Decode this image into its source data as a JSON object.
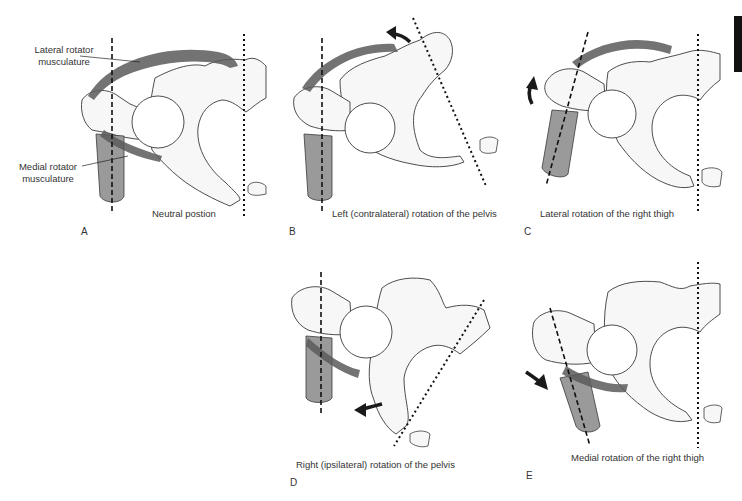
{
  "figure": {
    "colors": {
      "bone_fill": "#f7f7f7",
      "bone_outline": "#3a3a3a",
      "muscle": "#5a5a5a",
      "thigh": "#9a9a9a",
      "arrow": "#1a1a1a",
      "tab_marker": "#111111"
    },
    "callouts": {
      "lateral": "Lateral rotator musculature",
      "lateral_line1": "Lateral rotator",
      "lateral_line2": "musculature",
      "medial": "Medial rotator musculature",
      "medial_line1": "Medial rotator",
      "medial_line2": "musculature"
    },
    "panels": [
      {
        "letter": "A",
        "caption": "Neutral postion"
      },
      {
        "letter": "B",
        "caption": "Left (contralateral) rotation of the pelvis"
      },
      {
        "letter": "C",
        "caption": "Lateral rotation of the right thigh"
      },
      {
        "letter": "D",
        "caption": "Right (ipsilateral) rotation of the pelvis"
      },
      {
        "letter": "E",
        "caption": "Medial rotation of the right thigh"
      }
    ]
  }
}
